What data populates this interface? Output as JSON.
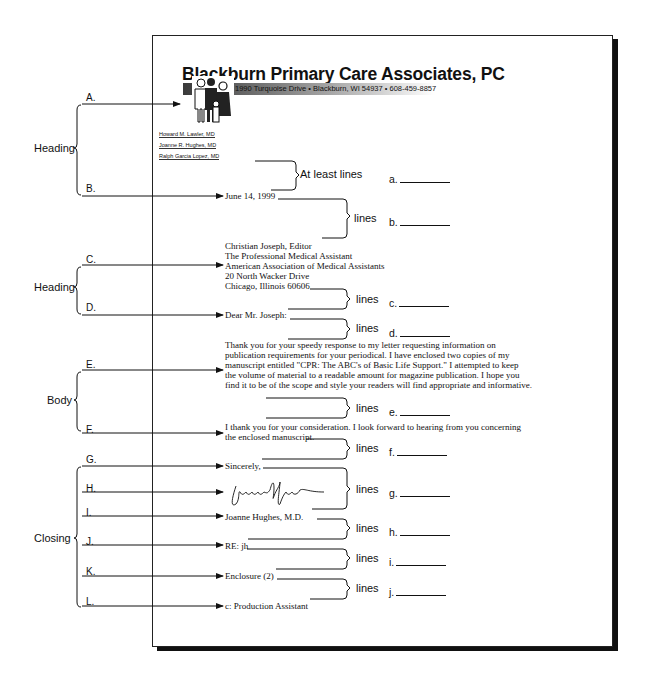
{
  "letterhead": {
    "practice_name": "Blackburn Primary Care Associates, PC",
    "address_line": "1990 Turquoise Drive  •  Blackburn, WI 54937  •  608-459-8857",
    "logo_icon": "family-figures-icon",
    "doctors": [
      "Howard M. Lawler, MD",
      "Joanne R. Hughes, MD",
      "Ralph Garcia Lopez, MD"
    ]
  },
  "letter": {
    "date": "June 14, 1999",
    "inside_address": [
      "Christian Joseph, Editor",
      "The Professional Medical Assistant",
      "American Association of Medical Assistants",
      "20 North Wacker Drive",
      "Chicago, Illinois 60606"
    ],
    "salutation": "Dear Mr. Joseph:",
    "body_paragraph_1": [
      "Thank you for your speedy response to my letter requesting information on",
      "publication requirements for your periodical.  I have enclosed two copies of my",
      "manuscript entitled \"CPR: The ABC's of Basic Life Support.\"  I attempted to keep",
      "the volume of material to a readable amount for magazine publication.  I hope you",
      "find it to be of the scope and style your  readers will find appropriate and informative."
    ],
    "body_paragraph_2": [
      "I thank you for your consideration.  I look forward to hearing from you concerning",
      "the enclosed manuscript."
    ],
    "complimentary_close": "Sincerely,",
    "signature": "Joanne Hughes",
    "signer": "Joanne Hughes, M.D.",
    "reference_initials": "RE: jh",
    "enclosure": "Enclosure (2)",
    "copy_notation": "c: Production Assistant"
  },
  "diagram": {
    "sections": [
      {
        "name": "Heading",
        "labels": [
          "A.",
          "B."
        ]
      },
      {
        "name": "Heading",
        "labels": [
          "C.",
          "D."
        ]
      },
      {
        "name": "Body",
        "labels": [
          "E.",
          "F."
        ]
      },
      {
        "name": "Closing",
        "labels": [
          "G.",
          "H.",
          "I.",
          "J.",
          "K.",
          "L."
        ]
      }
    ],
    "spacing_labels": [
      "At least lines",
      "lines",
      "lines",
      "lines",
      "lines",
      "lines",
      "lines",
      "lines",
      "lines",
      "lines"
    ],
    "answer_blanks": [
      "a.",
      "b.",
      "c.",
      "d.",
      "e.",
      "f.",
      "g.",
      "h.",
      "i.",
      "j."
    ]
  }
}
